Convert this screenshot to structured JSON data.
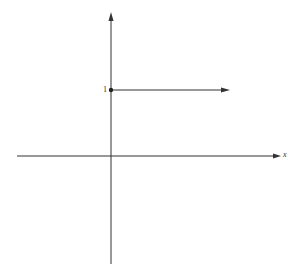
{
  "diagram": {
    "type": "step-function-graph",
    "axes": {
      "x_label": "x",
      "y_label": "",
      "origin": {
        "px": 111,
        "py": 156
      },
      "x_axis": {
        "x_start": 17,
        "x_end": 280
      },
      "y_axis": {
        "y_start": 14,
        "y_end": 264
      }
    },
    "y_tick_label": "1",
    "segment": {
      "y_value": 1,
      "start_x": 111,
      "end_x": 228,
      "y_px": 90,
      "start_marker": "filled-dot",
      "end_marker": "arrow"
    },
    "colors": {
      "line": "#333333",
      "background": "#ffffff"
    }
  }
}
